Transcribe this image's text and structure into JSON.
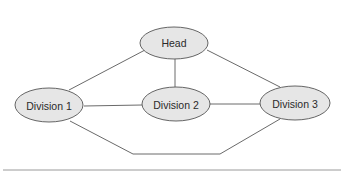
{
  "diagram": {
    "type": "network",
    "nodes": [
      {
        "id": "head",
        "label": "Head"
      },
      {
        "id": "div1",
        "label": "Division 1"
      },
      {
        "id": "div2",
        "label": "Division 2"
      },
      {
        "id": "div3",
        "label": "Division 3"
      }
    ],
    "edges": [
      {
        "from": "head",
        "to": "div1"
      },
      {
        "from": "head",
        "to": "div2"
      },
      {
        "from": "head",
        "to": "div3"
      },
      {
        "from": "div1",
        "to": "div2"
      },
      {
        "from": "div2",
        "to": "div3"
      },
      {
        "from": "div1",
        "to": "div3",
        "route": "bottom"
      }
    ],
    "colors": {
      "node_fill": "#e6e6e6",
      "node_stroke": "#555555",
      "edge": "#6a6a6a",
      "rule": "#9a9a9a"
    }
  }
}
